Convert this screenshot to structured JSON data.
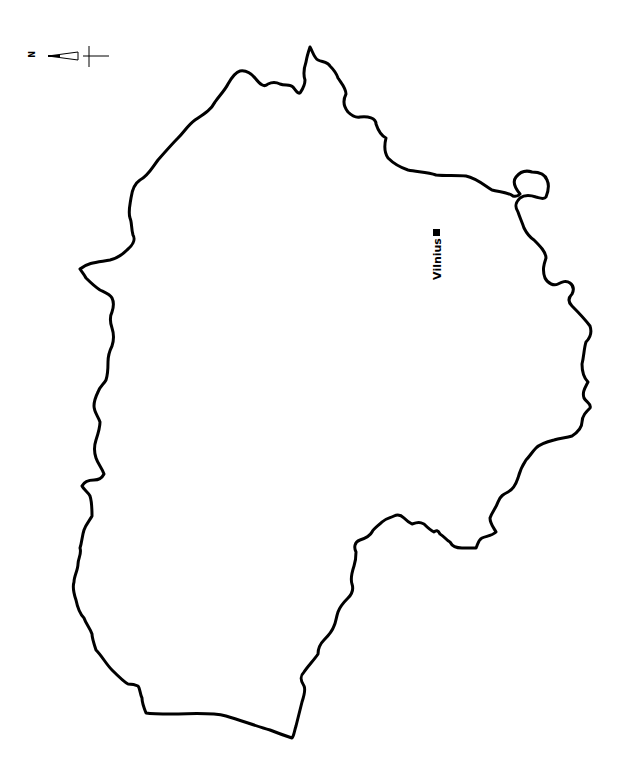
{
  "map": {
    "orientation": "rotated 90 degrees (north points left)",
    "north_arrow": {
      "label": "N",
      "icon": "north-arrow-icon"
    },
    "cities": [
      {
        "name": "Vilnius",
        "marker": "square-marker-icon"
      }
    ],
    "colors": {
      "outline": "#000000",
      "fill": "#ffffff",
      "background": "#ffffff"
    }
  }
}
